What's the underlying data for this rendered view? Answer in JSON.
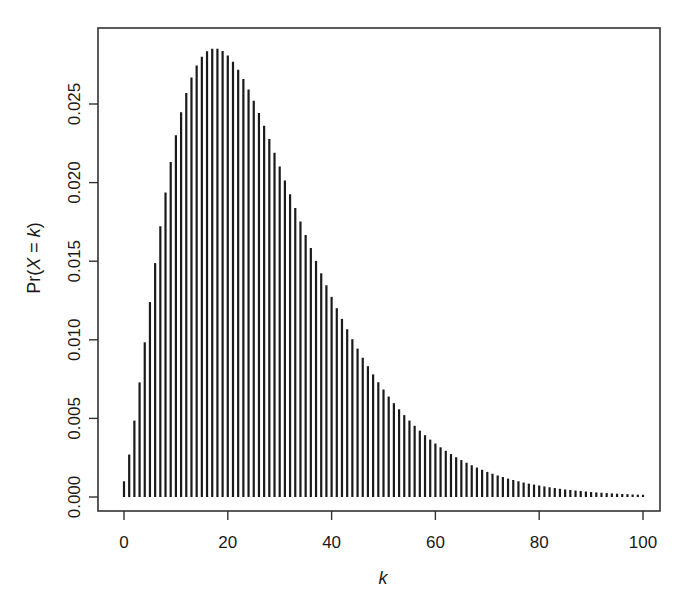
{
  "chart_data": {
    "type": "bar",
    "style": "vertical spikes (probability mass function)",
    "title": "",
    "xlabel": "k",
    "ylabel": "Pr(X = k)",
    "xlim": [
      0,
      100
    ],
    "ylim": [
      0,
      0.0285
    ],
    "x_ticks": [
      0,
      20,
      40,
      60,
      80,
      100
    ],
    "x_tick_labels": [
      "0",
      "20",
      "40",
      "60",
      "80",
      "100"
    ],
    "y_ticks": [
      0.0,
      0.005,
      0.01,
      0.015,
      0.02,
      0.025
    ],
    "y_tick_labels": [
      "0.000",
      "0.005",
      "0.010",
      "0.015",
      "0.020",
      "0.025"
    ],
    "grid": false,
    "legend": null,
    "bar_color": "#1a1a1a",
    "x": [
      0,
      1,
      2,
      3,
      4,
      5,
      6,
      7,
      8,
      9,
      10,
      11,
      12,
      13,
      14,
      15,
      16,
      17,
      18,
      19,
      20,
      21,
      22,
      23,
      24,
      25,
      26,
      27,
      28,
      29,
      30,
      31,
      32,
      33,
      34,
      35,
      36,
      37,
      38,
      39,
      40,
      41,
      42,
      43,
      44,
      45,
      46,
      47,
      48,
      49,
      50,
      51,
      52,
      53,
      54,
      55,
      56,
      57,
      58,
      59,
      60,
      61,
      62,
      63,
      64,
      65,
      66,
      67,
      68,
      69,
      70,
      71,
      72,
      73,
      74,
      75,
      76,
      77,
      78,
      79,
      80,
      81,
      82,
      83,
      84,
      85,
      86,
      87,
      88,
      89,
      90,
      91,
      92,
      93,
      94,
      95,
      96,
      97,
      98,
      99,
      100
    ],
    "values": [
      0.001,
      0.0027,
      0.00486,
      0.00729,
      0.00984,
      0.0124,
      0.01488,
      0.01722,
      0.01937,
      0.02131,
      0.02301,
      0.02448,
      0.0257,
      0.02669,
      0.02745,
      0.028,
      0.02835,
      0.02852,
      0.02852,
      0.02837,
      0.02808,
      0.02768,
      0.02718,
      0.02659,
      0.02592,
      0.0252,
      0.02442,
      0.02361,
      0.02277,
      0.0219,
      0.02103,
      0.02014,
      0.01926,
      0.01839,
      0.01752,
      0.01667,
      0.01584,
      0.01502,
      0.01423,
      0.01347,
      0.01273,
      0.01201,
      0.01133,
      0.01067,
      0.01004,
      0.00944,
      0.00886,
      0.00832,
      0.0078,
      0.0073,
      0.00684,
      0.00639,
      0.00597,
      0.00558,
      0.00521,
      0.00486,
      0.00453,
      0.00422,
      0.00393,
      0.00365,
      0.0034,
      0.00316,
      0.00294,
      0.00273,
      0.00253,
      0.00235,
      0.00218,
      0.00202,
      0.00187,
      0.00173,
      0.0016,
      0.00148,
      0.00137,
      0.00127,
      0.00117,
      0.00108,
      0.001,
      0.00092,
      0.00085,
      0.00079,
      0.00073,
      0.00067,
      0.00062,
      0.00057,
      0.00052,
      0.00048,
      0.00045,
      0.00041,
      0.00038,
      0.00035,
      0.00032,
      0.00029,
      0.00027,
      0.00025,
      0.00023,
      0.00021,
      0.00019,
      0.00018,
      0.00016,
      0.00015,
      0.00014
    ]
  }
}
